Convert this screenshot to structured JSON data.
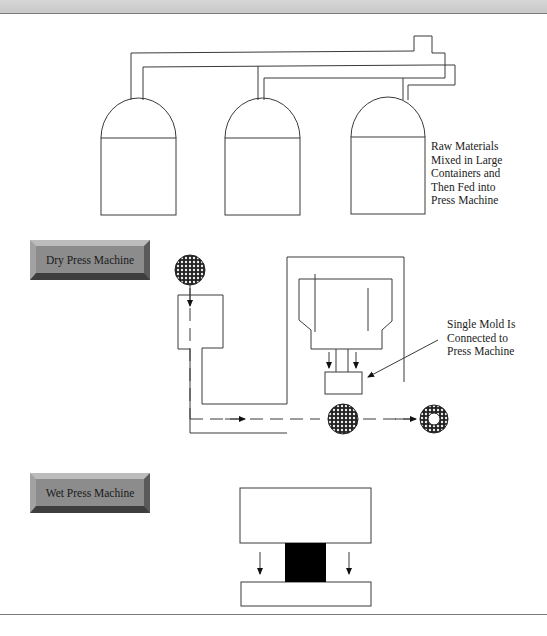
{
  "header": {
    "band": "top-gray-band"
  },
  "tanks": {
    "count": 3,
    "caption": [
      "Raw Materials",
      "Mixed in Large",
      "Containers and",
      "Then Fed into",
      "Press Machine"
    ]
  },
  "dry_press": {
    "label": "Dry Press Machine",
    "mold_caption": [
      "Single Mold Is",
      "Connected to",
      "Press Machine"
    ],
    "icons": [
      "granule-ball-icon",
      "granule-ball-icon",
      "granule-ring-icon"
    ]
  },
  "wet_press": {
    "label": "Wet Press Machine"
  },
  "colors": {
    "line": "#3a3a3a",
    "button_face": "#8c8c8c",
    "band": "#d0d0d0",
    "block": "#000000"
  }
}
